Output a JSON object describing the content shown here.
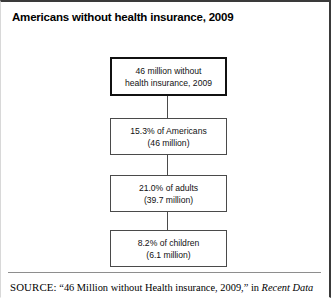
{
  "figure": {
    "title": "Americans without health insurance, 2009",
    "background_color": "#ffffff",
    "border_color": "#3a3a3a"
  },
  "flowchart": {
    "type": "flow",
    "orientation": "vertical",
    "nodes": [
      {
        "id": "total",
        "emphasis": true,
        "lines": [
          "46 million without",
          "health insurance, 2009"
        ]
      },
      {
        "id": "all-americans",
        "emphasis": false,
        "lines": [
          "15.3% of Americans",
          "(46 million)"
        ]
      },
      {
        "id": "adults",
        "emphasis": false,
        "lines": [
          "21.0% of adults",
          "(39.7 million)"
        ]
      },
      {
        "id": "children",
        "emphasis": false,
        "lines": [
          "8.2% of children",
          "(6.1 million)"
        ]
      }
    ]
  },
  "chart_data": {
    "type": "table",
    "title": "Americans without health insurance, 2009",
    "categories": [
      "Total uninsured",
      "All Americans",
      "Adults",
      "Children"
    ],
    "percent_values": [
      null,
      15.3,
      21.0,
      8.2
    ],
    "millions_values": [
      46,
      46,
      39.7,
      6.1
    ],
    "value_labels": [
      "46 million without health insurance, 2009",
      "15.3% of Americans (46 million)",
      "21.0% of adults (39.7 million)",
      "8.2% of children (6.1 million)"
    ],
    "xlabel": "",
    "ylabel": "",
    "grid": false,
    "legend": "none"
  },
  "footer": {
    "source_label": "SOURCE:",
    "source_text_quoted": "“46 Million without Health insurance, 2009,”",
    "source_connector": "in",
    "source_publication": "Recent Data"
  }
}
